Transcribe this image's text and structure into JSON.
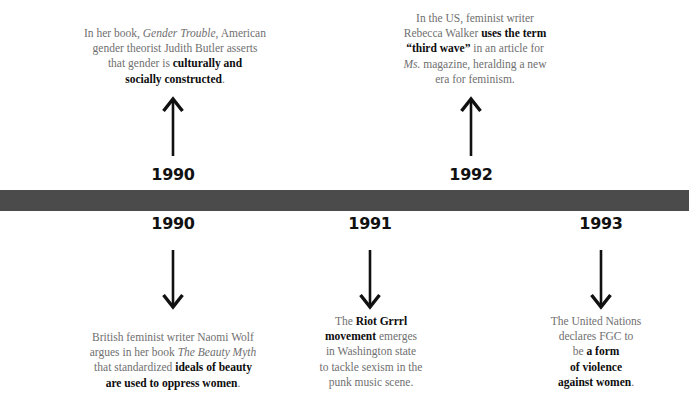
{
  "diagram": {
    "type": "timeline",
    "bar_color": "#4b4b4b",
    "background_color": "#ffffff",
    "body_text_color": "#6f6f6f",
    "emphasis_text_color": "#0d0d0d"
  },
  "years": {
    "above": [
      {
        "label": "1990"
      },
      {
        "label": "1992"
      }
    ],
    "below": [
      {
        "label": "1990"
      },
      {
        "label": "1991"
      },
      {
        "label": "1993"
      }
    ]
  },
  "events": {
    "above": [
      {
        "year": "1990",
        "arrow": "arrow-up-icon",
        "lines": [
          [
            {
              "text": "In her book, ",
              "style": "normal"
            },
            {
              "text": "Gender Trouble",
              "style": "italic"
            },
            {
              "text": ", American",
              "style": "normal"
            }
          ],
          [
            {
              "text": "gender theorist Judith Butler asserts",
              "style": "normal"
            }
          ],
          [
            {
              "text": "that gender is ",
              "style": "normal"
            },
            {
              "text": "culturally and",
              "style": "bold"
            }
          ],
          [
            {
              "text": "socially constructed",
              "style": "bold"
            },
            {
              "text": ".",
              "style": "normal"
            }
          ]
        ]
      },
      {
        "year": "1992",
        "arrow": "arrow-up-icon",
        "lines": [
          [
            {
              "text": "In the US, feminist writer",
              "style": "normal"
            }
          ],
          [
            {
              "text": "Rebecca Walker ",
              "style": "normal"
            },
            {
              "text": "uses the term",
              "style": "bold"
            }
          ],
          [
            {
              "text": "“third wave”",
              "style": "bold"
            },
            {
              "text": " in an article for",
              "style": "normal"
            }
          ],
          [
            {
              "text": "Ms.",
              "style": "italic"
            },
            {
              "text": " magazine, heralding a new",
              "style": "normal"
            }
          ],
          [
            {
              "text": "era for feminism.",
              "style": "normal"
            }
          ]
        ]
      }
    ],
    "below": [
      {
        "year": "1990",
        "arrow": "arrow-down-icon",
        "lines": [
          [
            {
              "text": "British feminist writer Naomi Wolf",
              "style": "normal"
            }
          ],
          [
            {
              "text": "argues in her book ",
              "style": "normal"
            },
            {
              "text": "The Beauty Myth",
              "style": "italic"
            }
          ],
          [
            {
              "text": "that standardized ",
              "style": "normal"
            },
            {
              "text": "ideals of beauty",
              "style": "bold"
            }
          ],
          [
            {
              "text": "are used to oppress women",
              "style": "bold"
            },
            {
              "text": ".",
              "style": "normal"
            }
          ]
        ]
      },
      {
        "year": "1991",
        "arrow": "arrow-down-icon",
        "lines": [
          [
            {
              "text": "The ",
              "style": "normal"
            },
            {
              "text": "Riot Grrrl",
              "style": "bold"
            }
          ],
          [
            {
              "text": "movement",
              "style": "bold"
            },
            {
              "text": " emerges",
              "style": "normal"
            }
          ],
          [
            {
              "text": "in Washington state",
              "style": "normal"
            }
          ],
          [
            {
              "text": "to tackle sexism in the",
              "style": "normal"
            }
          ],
          [
            {
              "text": "punk music scene.",
              "style": "normal"
            }
          ]
        ]
      },
      {
        "year": "1993",
        "arrow": "arrow-down-icon",
        "lines": [
          [
            {
              "text": "The United Nations",
              "style": "normal"
            }
          ],
          [
            {
              "text": "declares FGC to",
              "style": "normal"
            }
          ],
          [
            {
              "text": "be ",
              "style": "normal"
            },
            {
              "text": "a form",
              "style": "bold"
            }
          ],
          [
            {
              "text": "of violence",
              "style": "bold"
            }
          ],
          [
            {
              "text": "against women",
              "style": "bold"
            },
            {
              "text": ".",
              "style": "normal"
            }
          ]
        ]
      }
    ]
  }
}
